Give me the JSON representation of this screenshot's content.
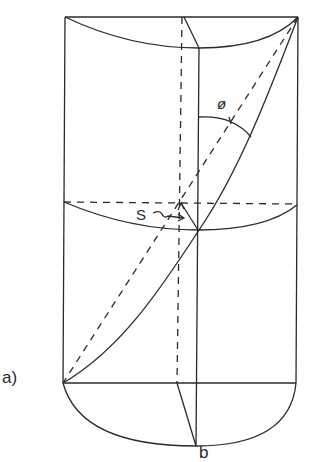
{
  "figure": {
    "panel_label": "a)",
    "bottom_label": "b",
    "angle_label": "ø",
    "arrow_label": "S",
    "stroke_color": "#2a2a2a",
    "background": "#ffffff"
  }
}
